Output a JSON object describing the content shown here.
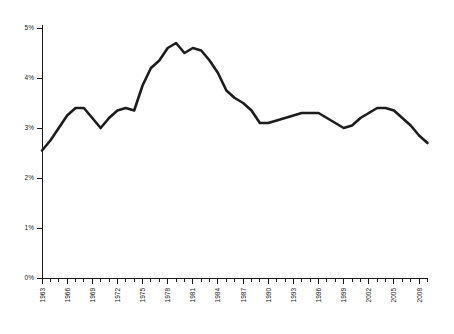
{
  "chart_data": {
    "type": "line",
    "title": "",
    "subtitle": "",
    "xlabel": "",
    "ylabel": "",
    "xlim": [
      1963,
      2009
    ],
    "ylim": [
      0,
      5
    ],
    "grid": false,
    "legend": false,
    "legend_position": "none",
    "line_color": "#1c1c1c",
    "axis_color": "#1a1a1a",
    "background_color": "#ffffff",
    "y_ticks": [
      0,
      1,
      2,
      3,
      4,
      5
    ],
    "y_tick_labels": [
      "0%",
      "1%",
      "2%",
      "3%",
      "4%",
      "5%"
    ],
    "x_tick_labels": [
      "1963",
      "1966",
      "1969",
      "1972",
      "1975",
      "1978",
      "1981",
      "1984",
      "1987",
      "1990",
      "1993",
      "1996",
      "1999",
      "2002",
      "2005",
      "2008"
    ],
    "x_tick_label_step": 3,
    "x_minor_tick_step": 1,
    "x": [
      1963,
      1964,
      1965,
      1966,
      1967,
      1968,
      1969,
      1970,
      1971,
      1972,
      1973,
      1974,
      1975,
      1976,
      1977,
      1978,
      1979,
      1980,
      1981,
      1982,
      1983,
      1984,
      1985,
      1986,
      1987,
      1988,
      1989,
      1990,
      1991,
      1992,
      1993,
      1994,
      1995,
      1996,
      1997,
      1998,
      1999,
      2000,
      2001,
      2002,
      2003,
      2004,
      2005,
      2006,
      2007,
      2008,
      2009
    ],
    "values": [
      2.55,
      2.75,
      3.0,
      3.25,
      3.4,
      3.4,
      3.2,
      3.0,
      3.2,
      3.35,
      3.4,
      3.35,
      3.85,
      4.2,
      4.35,
      4.6,
      4.7,
      4.5,
      4.6,
      4.55,
      4.35,
      4.1,
      3.75,
      3.6,
      3.5,
      3.35,
      3.1,
      3.1,
      3.15,
      3.2,
      3.25,
      3.3,
      3.3,
      3.3,
      3.2,
      3.1,
      3.0,
      3.05,
      3.2,
      3.3,
      3.4,
      3.4,
      3.35,
      3.2,
      3.05,
      2.85,
      2.7
    ],
    "series": [
      {
        "name": "series-1",
        "values": [
          2.55,
          2.75,
          3.0,
          3.25,
          3.4,
          3.4,
          3.2,
          3.0,
          3.2,
          3.35,
          3.4,
          3.35,
          3.85,
          4.2,
          4.35,
          4.6,
          4.7,
          4.5,
          4.6,
          4.55,
          4.35,
          4.1,
          3.75,
          3.6,
          3.5,
          3.35,
          3.1,
          3.1,
          3.15,
          3.2,
          3.25,
          3.3,
          3.3,
          3.3,
          3.2,
          3.1,
          3.0,
          3.05,
          3.2,
          3.3,
          3.4,
          3.4,
          3.35,
          3.2,
          3.05,
          2.85,
          2.7
        ]
      }
    ]
  }
}
